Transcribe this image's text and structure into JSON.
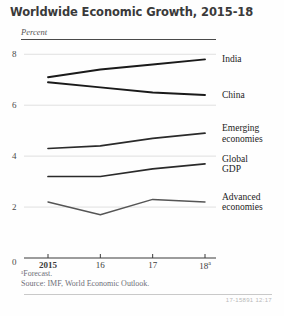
{
  "figure": {
    "title": "Worldwide Economic Growth, 2015-18",
    "unit_label": "Percent",
    "footnote_forecast": "ᵃForecast.",
    "footnote_source": "Source: IMF, World Economic Outlook.",
    "print_code": "17-15891  12:17"
  },
  "chart_data": {
    "type": "line",
    "title": "Worldwide Economic Growth, 2015-18",
    "xlabel": "",
    "ylabel": "Percent",
    "categories": [
      "2015",
      "16",
      "17",
      "18"
    ],
    "x_tick_labels": [
      "2015",
      "16",
      "17",
      "18"
    ],
    "x_tick_superscripts": [
      "",
      "",
      "",
      "a"
    ],
    "y_tick_labels": [
      "0",
      "2",
      "4",
      "6",
      "8"
    ],
    "y_ticks": [
      0,
      2,
      4,
      6,
      8
    ],
    "ylim": [
      0,
      8.6
    ],
    "grid": true,
    "legend_position": "right-inline",
    "series": [
      {
        "name": "India",
        "label": "India",
        "values": [
          7.1,
          7.4,
          7.6,
          7.8
        ],
        "color": "#1a1a1a"
      },
      {
        "name": "China",
        "label": "China",
        "values": [
          6.9,
          6.7,
          6.5,
          6.4
        ],
        "color": "#1a1a1a"
      },
      {
        "name": "Emerging economies",
        "label": "Emerging\neconomies",
        "values": [
          4.3,
          4.4,
          4.7,
          4.9
        ],
        "color": "#2a2a2a"
      },
      {
        "name": "Global GDP",
        "label": "Global\nGDP",
        "values": [
          3.2,
          3.2,
          3.5,
          3.7
        ],
        "color": "#2a2a2a"
      },
      {
        "name": "Advanced economies",
        "label": "Advanced\neconomies",
        "values": [
          2.2,
          1.7,
          2.3,
          2.2
        ],
        "color": "#555555"
      }
    ],
    "annotations": [
      "ᵃForecast.",
      "Source: IMF, World Economic Outlook."
    ]
  }
}
